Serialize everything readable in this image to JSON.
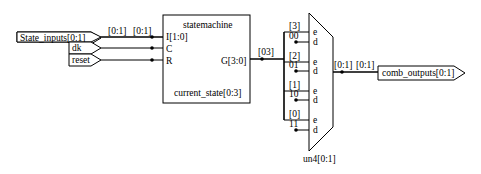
{
  "inputs": [
    {
      "label": "State_inputs[0:1]"
    },
    {
      "label": "dk"
    },
    {
      "label": "reset"
    }
  ],
  "input_bus_labels": [
    "[0:1]",
    "[0:1]"
  ],
  "statemachine": {
    "title": "statemachine",
    "pins_in": [
      "I[1:0]",
      "C",
      "R"
    ],
    "pin_out": "G[3:0]",
    "instance": "current_state[0:3]"
  },
  "g_bus_label": "[03]",
  "mux": {
    "instance": "un4[0:1]",
    "rows": [
      {
        "bit": "[3]",
        "value": "00",
        "e": "e",
        "d": "d"
      },
      {
        "bit": "[2]",
        "value": "01",
        "e": "e",
        "d": "d"
      },
      {
        "bit": "[1]",
        "value": "10",
        "e": "e",
        "d": "d"
      },
      {
        "bit": "[0]",
        "value": "11",
        "e": "e",
        "d": "d"
      }
    ]
  },
  "output_bus_labels": [
    "[0:1]",
    "[0:1]"
  ],
  "output": {
    "label": "comb_outputs[0:1]"
  }
}
